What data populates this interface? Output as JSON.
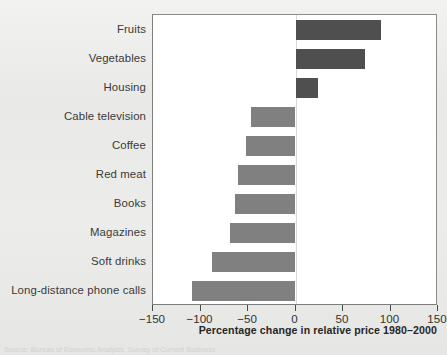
{
  "figure": {
    "background_color": "#eaeae8",
    "plot_background_color": "#ffffff",
    "frame_color": "#7c7c7c",
    "caption": "Source: Bureau of Economic Analysis, Survey of Current Business."
  },
  "chart_data": {
    "type": "bar",
    "orientation": "horizontal",
    "title": "",
    "subtitle": "",
    "xlabel": "Percentage change in relative price 1980–2000",
    "ylabel": "",
    "xlim": [
      -150,
      150
    ],
    "xticks": [
      -150,
      -100,
      -50,
      0,
      50,
      100,
      150
    ],
    "xticklabels": [
      "−150",
      "−100",
      "−50",
      "0",
      "50",
      "100",
      "150"
    ],
    "grid": false,
    "legend": null,
    "categories": [
      "Fruits",
      "Vegetables",
      "Housing",
      "Cable television",
      "Coffee",
      "Red meat",
      "Books",
      "Magazines",
      "Soft drinks",
      "Long-distance phone calls"
    ],
    "values": [
      90,
      73,
      24,
      -47,
      -52,
      -61,
      -64,
      -69,
      -88,
      -109
    ],
    "bar_colors": [
      "#4f4f4f",
      "#4f4f4f",
      "#4f4f4f",
      "#808080",
      "#808080",
      "#808080",
      "#808080",
      "#808080",
      "#808080",
      "#808080"
    ],
    "positive_color": "#4f4f4f",
    "negative_color": "#808080"
  }
}
